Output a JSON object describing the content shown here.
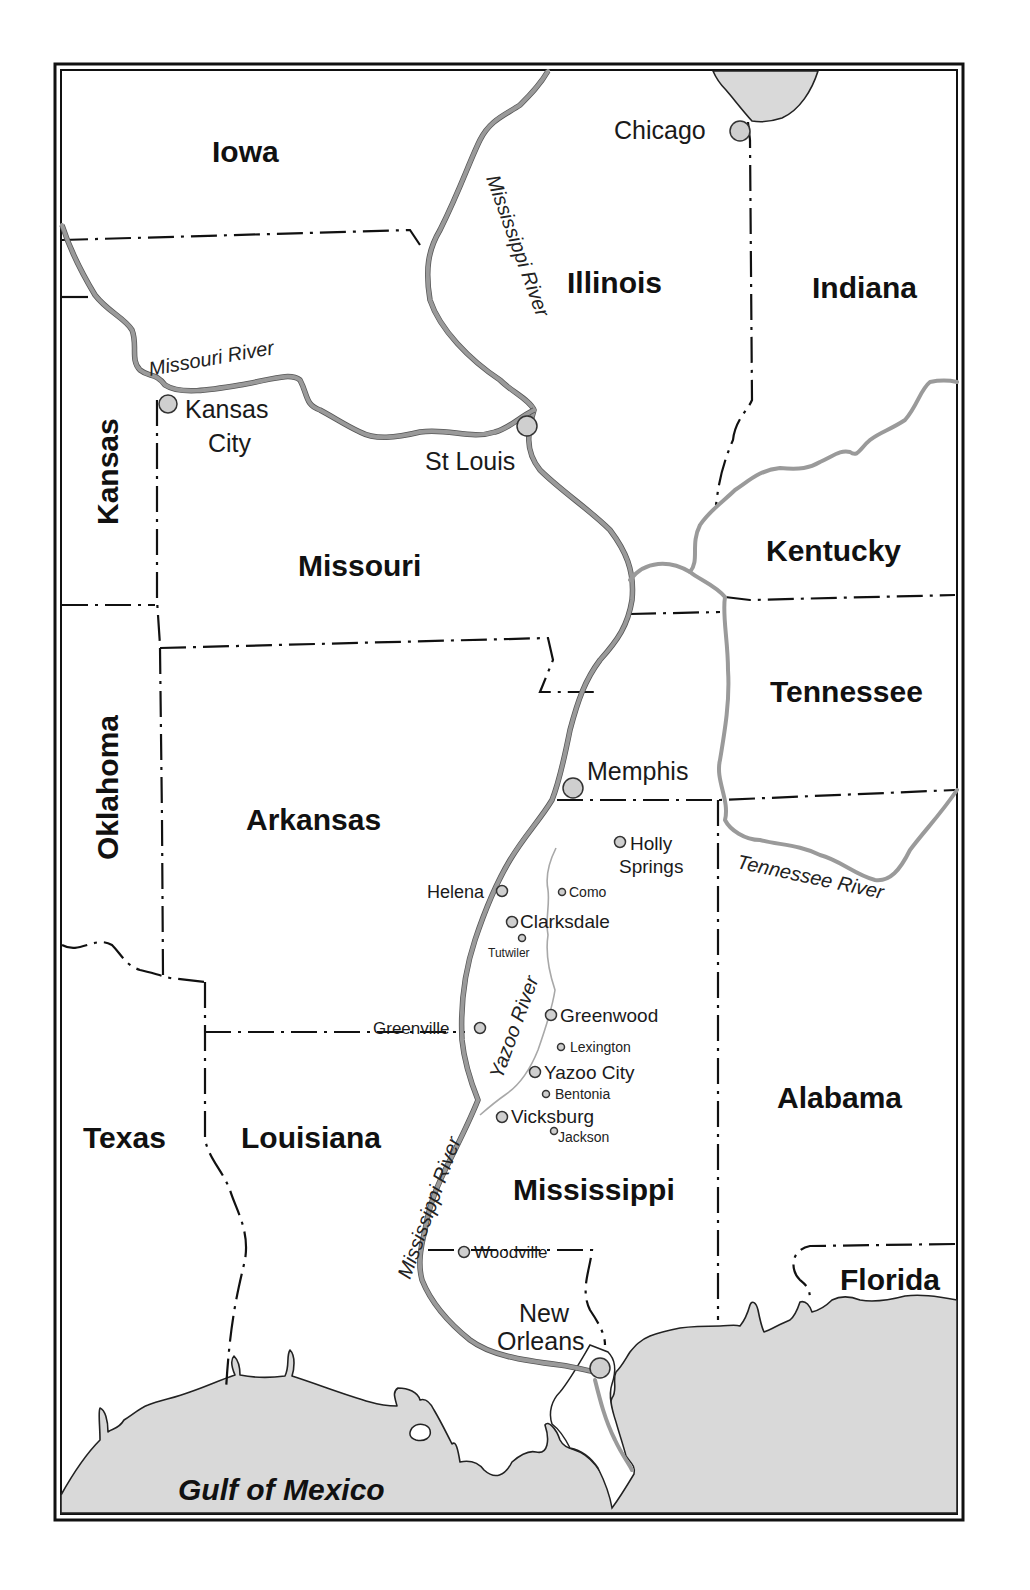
{
  "map": {
    "states": [
      {
        "name": "Iowa"
      },
      {
        "name": "Illinois"
      },
      {
        "name": "Indiana"
      },
      {
        "name": "Kansas"
      },
      {
        "name": "Missouri"
      },
      {
        "name": "Kentucky"
      },
      {
        "name": "Oklahoma"
      },
      {
        "name": "Tennessee"
      },
      {
        "name": "Arkansas"
      },
      {
        "name": "Texas"
      },
      {
        "name": "Louisiana"
      },
      {
        "name": "Mississippi"
      },
      {
        "name": "Alabama"
      },
      {
        "name": "Florida"
      }
    ],
    "major_cities": [
      {
        "name": "Chicago"
      },
      {
        "name": "Kansas"
      },
      {
        "name": "City"
      },
      {
        "name": "St Louis"
      },
      {
        "name": "Memphis"
      },
      {
        "name": "New"
      },
      {
        "name": "Orleans"
      }
    ],
    "towns": [
      {
        "name": "Holly"
      },
      {
        "name": "Springs"
      },
      {
        "name": "Helena"
      },
      {
        "name": "Como"
      },
      {
        "name": "Clarksdale"
      },
      {
        "name": "Tutwiler"
      },
      {
        "name": "Greenwood"
      },
      {
        "name": "Greenville"
      },
      {
        "name": "Lexington"
      },
      {
        "name": "Yazoo City"
      },
      {
        "name": "Bentonia"
      },
      {
        "name": "Vicksburg"
      },
      {
        "name": "Jackson"
      },
      {
        "name": "Woodville"
      }
    ],
    "rivers": [
      {
        "name": "Mississippi River"
      },
      {
        "name": "Missouri River"
      },
      {
        "name": "Tennessee River"
      },
      {
        "name": "Yazoo River"
      },
      {
        "name": "Mississippi River"
      }
    ],
    "water_bodies": [
      {
        "name": "Gulf of Mexico"
      }
    ],
    "colors": {
      "water": "#d9d9d9",
      "river": "#9a9a9a",
      "border": "#111111",
      "city_dot": "#cfcfcf"
    }
  }
}
